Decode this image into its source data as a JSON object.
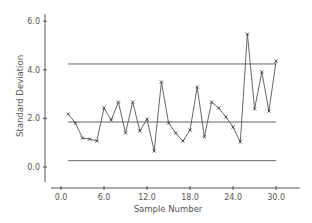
{
  "chart_data": {
    "type": "line",
    "title": "",
    "xlabel": "Sample Number",
    "ylabel": "Standard Deviation",
    "xlim": [
      -1.5,
      33.5
    ],
    "ylim": [
      -0.8,
      6.2
    ],
    "x_ticks": [
      0.0,
      6.0,
      12.0,
      18.0,
      24.0,
      30.0
    ],
    "x_tick_labels": [
      "0.0",
      "6.0",
      "12.0",
      "18.0",
      "24.0",
      "30.0"
    ],
    "y_ticks": [
      0.0,
      2.0,
      4.0,
      6.0
    ],
    "y_tick_labels": [
      "0.0",
      "2.0",
      "4.0",
      "6.0"
    ],
    "grid": false,
    "legend": null,
    "series": [
      {
        "name": "Sample standard deviation",
        "marker": "x",
        "x": [
          1,
          2,
          3,
          4,
          5,
          6,
          7,
          8,
          9,
          10,
          11,
          12,
          13,
          14,
          15,
          16,
          17,
          18,
          19,
          20,
          21,
          22,
          23,
          24,
          25,
          26,
          27,
          28,
          29,
          30
        ],
        "values": [
          2.18,
          1.81,
          1.19,
          1.15,
          1.07,
          2.43,
          1.93,
          2.67,
          1.4,
          2.67,
          1.48,
          1.97,
          0.66,
          3.5,
          1.81,
          1.4,
          1.07,
          1.52,
          3.29,
          1.24,
          2.67,
          2.43,
          2.06,
          1.64,
          1.03,
          5.47,
          2.39,
          3.91,
          2.3,
          4.36
        ]
      }
    ],
    "control_lines": [
      {
        "name": "UCL",
        "value": 4.24,
        "x_range": [
          1,
          30
        ]
      },
      {
        "name": "Center line",
        "value": 1.85,
        "x_range": [
          1,
          30
        ]
      },
      {
        "name": "LCL",
        "value": 0.26,
        "x_range": [
          1,
          30
        ]
      }
    ]
  }
}
